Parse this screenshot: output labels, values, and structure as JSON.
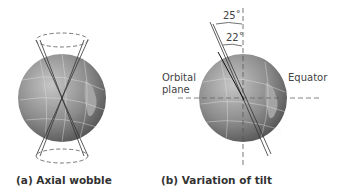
{
  "panels": [
    {
      "id": "a",
      "caption": "(a) Axial wobble"
    },
    {
      "id": "b",
      "caption": "(b) Variation of tilt",
      "labels": {
        "orbital_plane_line1": "Orbital",
        "orbital_plane_line2": "plane",
        "equator": "Equator"
      },
      "angles": {
        "outer": "25˚",
        "inner": "22˚"
      }
    }
  ],
  "colors": {
    "globe_dark": "#5f5f5f",
    "globe_light": "#bdbdbd",
    "line": "#333333",
    "dashed": "#666666"
  }
}
